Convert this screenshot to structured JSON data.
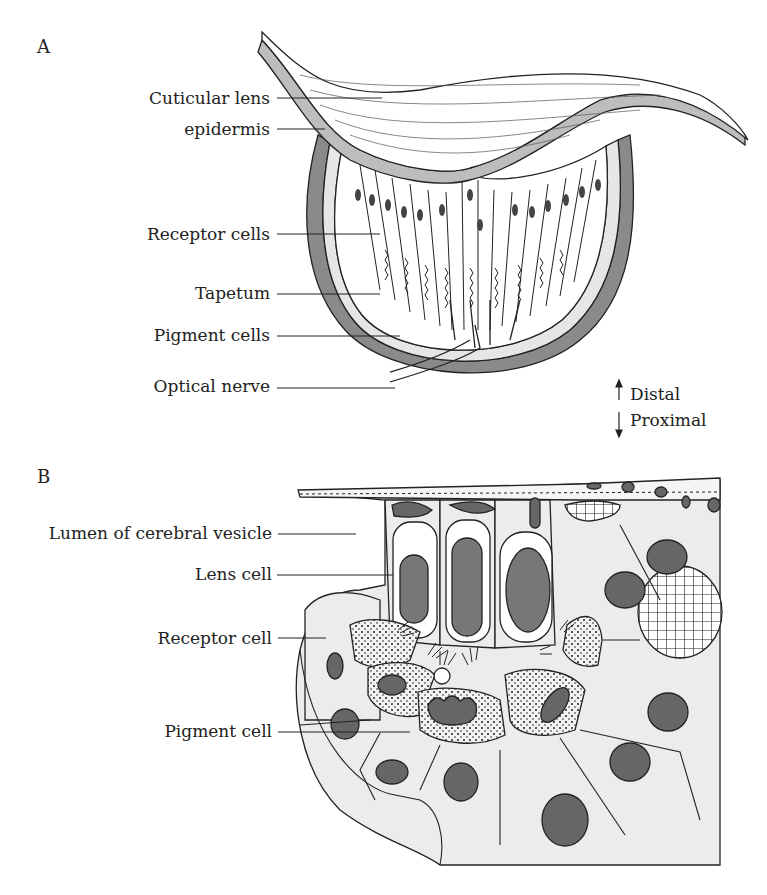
{
  "panels": {
    "a": {
      "letter": "A",
      "labels": {
        "cuticular_lens": "Cuticular lens",
        "epidermis": "epidermis",
        "receptor_cells": "Receptor cells",
        "tapetum": "Tapetum",
        "pigment_cells": "Pigment cells",
        "optical_nerve": "Optical nerve"
      }
    },
    "b": {
      "letter": "B",
      "labels": {
        "lumen": "Lumen of cerebral vesicle",
        "lens_cell": "Lens cell",
        "receptor_cell": "Receptor cell",
        "pigment_cell": "Pigment cell"
      }
    }
  },
  "orientation": {
    "distal": "Distal",
    "proximal": "Proximal"
  },
  "colors": {
    "line": "#222222",
    "gray": "#8a8a8a",
    "dark": "#5a5a5a",
    "light": "#ececec"
  }
}
